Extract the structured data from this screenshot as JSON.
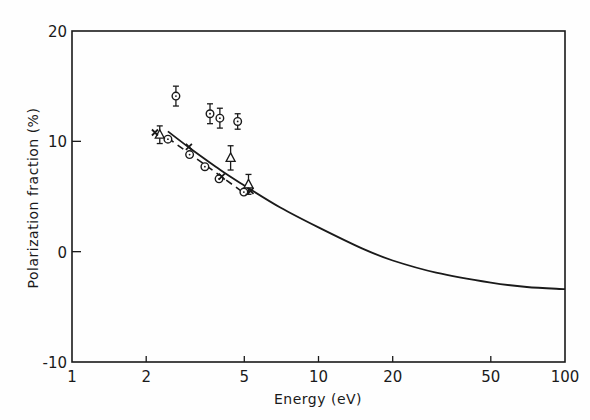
{
  "chart_data": {
    "type": "scatter",
    "title": "",
    "xlabel": "Energy (eV)",
    "ylabel": "Polarization fraction (%)",
    "xscale": "log",
    "xlim": [
      1,
      100
    ],
    "ylim": [
      -10,
      20
    ],
    "x_ticks": [
      1,
      2,
      5,
      10,
      20,
      50,
      100
    ],
    "x_tick_labels": [
      "1",
      "2",
      "5",
      "10",
      "20",
      "50",
      "100"
    ],
    "y_ticks": [
      -10,
      0,
      10,
      20
    ],
    "y_tick_labels": [
      "-10",
      "0",
      "10",
      "20"
    ],
    "grid": false,
    "legend": null,
    "series": [
      {
        "name": "circles (high)",
        "marker": "circle-dot",
        "points": [
          {
            "x": 2.64,
            "y": 14.1,
            "err": 0.9
          },
          {
            "x": 3.63,
            "y": 12.5,
            "err": 0.9
          },
          {
            "x": 3.98,
            "y": 12.1,
            "err": 0.9
          },
          {
            "x": 4.7,
            "y": 11.8,
            "err": 0.7
          }
        ]
      },
      {
        "name": "circles (low)",
        "marker": "circle-dot",
        "points": [
          {
            "x": 2.45,
            "y": 10.2,
            "err": 0
          },
          {
            "x": 3.0,
            "y": 8.8,
            "err": 0
          },
          {
            "x": 3.46,
            "y": 7.7,
            "err": 0
          },
          {
            "x": 3.95,
            "y": 6.6,
            "err": 0
          },
          {
            "x": 4.98,
            "y": 5.4,
            "err": 0
          }
        ]
      },
      {
        "name": "triangles",
        "marker": "triangle",
        "points": [
          {
            "x": 2.27,
            "y": 10.6,
            "err": 0.8
          },
          {
            "x": 4.4,
            "y": 8.5,
            "err": 1.1
          },
          {
            "x": 5.2,
            "y": 6.1,
            "err": 0.9
          }
        ]
      },
      {
        "name": "crosses",
        "marker": "cross",
        "points": [
          {
            "x": 2.17,
            "y": 10.8
          },
          {
            "x": 2.98,
            "y": 9.5
          },
          {
            "x": 4.05,
            "y": 6.8
          },
          {
            "x": 5.3,
            "y": 5.5
          }
        ]
      },
      {
        "name": "theory curve",
        "type": "line",
        "points": [
          {
            "x": 2.45,
            "y": 10.9
          },
          {
            "x": 3.0,
            "y": 9.4
          },
          {
            "x": 4.0,
            "y": 7.4
          },
          {
            "x": 5.0,
            "y": 6.0
          },
          {
            "x": 7.0,
            "y": 4.0
          },
          {
            "x": 10.0,
            "y": 2.2
          },
          {
            "x": 15.0,
            "y": 0.3
          },
          {
            "x": 20.0,
            "y": -0.8
          },
          {
            "x": 30.0,
            "y": -1.9
          },
          {
            "x": 50.0,
            "y": -2.8
          },
          {
            "x": 70.0,
            "y": -3.2
          },
          {
            "x": 100.0,
            "y": -3.4
          }
        ]
      },
      {
        "name": "dashed segment",
        "type": "dashed-line",
        "points": [
          {
            "x": 2.45,
            "y": 10.3
          },
          {
            "x": 5.0,
            "y": 5.3
          }
        ]
      }
    ]
  },
  "labels": {
    "xlabel": "Energy (eV)",
    "ylabel": "Polarization fraction (%)",
    "x_ticks": [
      "1",
      "2",
      "5",
      "10",
      "20",
      "50",
      "100"
    ],
    "y_ticks": [
      "20",
      "10",
      "0",
      "-10"
    ]
  }
}
